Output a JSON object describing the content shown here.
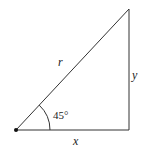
{
  "diagram": {
    "type": "right-triangle",
    "labels": {
      "hypotenuse": "r",
      "adjacent": "x",
      "opposite": "y",
      "angle": "45°"
    },
    "colors": {
      "line": "#333333",
      "text": "#222222",
      "background": "#ffffff"
    }
  }
}
